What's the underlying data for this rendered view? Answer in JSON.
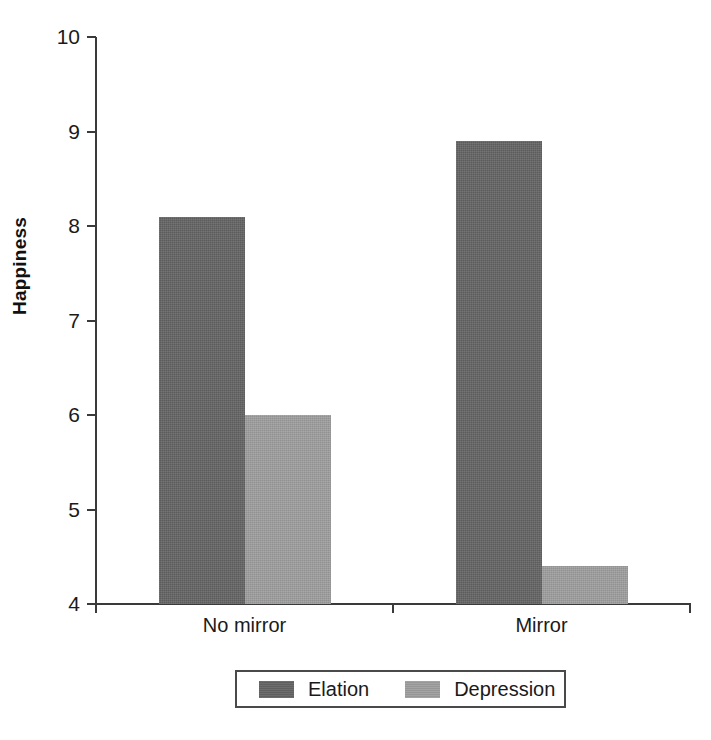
{
  "chart_data": {
    "type": "bar",
    "title": "",
    "subtitle": "",
    "xlabel": "",
    "ylabel": "Happiness",
    "categories": [
      "No mirror",
      "Mirror"
    ],
    "series": [
      {
        "name": "Elation",
        "values": [
          8.1,
          8.9
        ],
        "color": "#646464"
      },
      {
        "name": "Depression",
        "values": [
          6.0,
          4.4
        ],
        "color": "#9e9e9e"
      }
    ],
    "ylim": [
      4,
      10
    ],
    "ytick_labels": [
      "10",
      "9",
      "8",
      "7",
      "6",
      "5",
      "4"
    ],
    "ytick_values": [
      10,
      9,
      8,
      7,
      6,
      5,
      4
    ],
    "grid": false,
    "legend_position": "bottom",
    "legend_entries": [
      "Elation",
      "Depression"
    ],
    "bars_grouped": true,
    "bar_gap": 0,
    "background": "#ffffff",
    "axis_color": "#3a3a3a"
  }
}
